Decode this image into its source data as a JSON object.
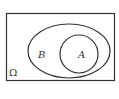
{
  "diagram": {
    "type": "venn",
    "universe": {
      "label": "Ω",
      "shape": "rectangle",
      "x": 6,
      "y": 13,
      "width": 108,
      "height": 67
    },
    "sets": [
      {
        "label": "B",
        "shape": "ellipse",
        "cx": 69,
        "cy": 51,
        "rx": 41,
        "ry": 27,
        "label_x": 41,
        "label_y": 58
      },
      {
        "label": "A",
        "shape": "circle",
        "cx": 79,
        "cy": 54,
        "r": 19,
        "label_x": 81,
        "label_y": 58
      }
    ],
    "relationship": "A is a subset of B",
    "stroke_color": "#333333",
    "background_color": "#ffffff"
  }
}
